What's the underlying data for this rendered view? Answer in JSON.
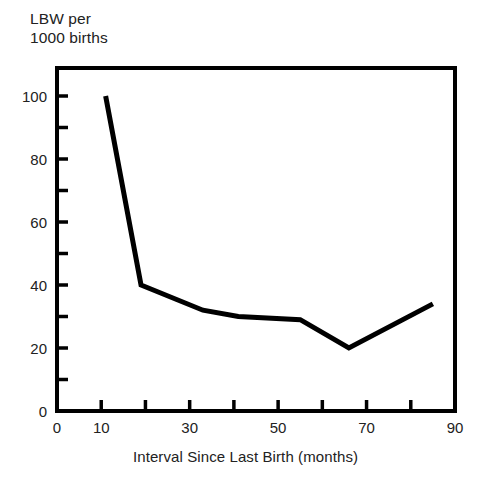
{
  "figure": {
    "y_axis_title": "LBW per\n1000 births",
    "x_axis_title": "Interval Since Last Birth (months)"
  },
  "chart_data": {
    "type": "line",
    "title": "",
    "subtitle": "",
    "xlabel": "Interval Since Last Birth (months)",
    "ylabel": "LBW per 1000 births",
    "xlim": [
      0,
      90
    ],
    "ylim": [
      0,
      110
    ],
    "grid": false,
    "legend": "none",
    "line_color": "#000000",
    "line_width": 5,
    "x_ticks_major": [
      0,
      10,
      30,
      50,
      70,
      90
    ],
    "x_ticks_minor": [
      20,
      40,
      60,
      80
    ],
    "x_tick_labels": [
      "0",
      "10",
      "30",
      "50",
      "70",
      "90"
    ],
    "y_ticks_major": [
      0,
      20,
      40,
      60,
      80,
      100
    ],
    "y_ticks_minor": [
      10,
      30,
      50,
      70,
      90
    ],
    "y_tick_labels": [
      "0",
      "20",
      "40",
      "60",
      "80",
      "100"
    ],
    "series": [
      {
        "name": "LBW rate",
        "points": [
          {
            "x": 11,
            "y": 100
          },
          {
            "x": 19,
            "y": 40
          },
          {
            "x": 33,
            "y": 32
          },
          {
            "x": 41,
            "y": 30
          },
          {
            "x": 55,
            "y": 29
          },
          {
            "x": 66,
            "y": 20
          },
          {
            "x": 85,
            "y": 34
          }
        ]
      }
    ]
  }
}
